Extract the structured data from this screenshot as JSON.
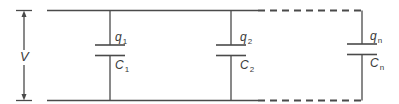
{
  "diagram": {
    "colors": {
      "wire": "#4a4a4a",
      "text": "#3a3a3a",
      "background": "#ffffff"
    },
    "voltage": {
      "label": "V"
    },
    "capacitors": [
      {
        "charge_symbol": "q",
        "charge_sub": "1",
        "cap_symbol": "C",
        "cap_sub": "1"
      },
      {
        "charge_symbol": "q",
        "charge_sub": "2",
        "cap_symbol": "C",
        "cap_sub": "2"
      },
      {
        "charge_symbol": "q",
        "charge_sub": "n",
        "cap_symbol": "C",
        "cap_sub": "n"
      }
    ],
    "wiring": {
      "top_rail": "solid then dashed",
      "bottom_rail": "solid then dashed",
      "continuation": "dashed lines indicate additional capacitors up to n"
    }
  }
}
